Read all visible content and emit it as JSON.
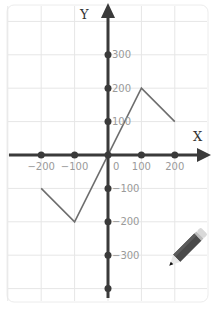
{
  "chart_data": {
    "type": "line",
    "title": "",
    "xlabel": "X",
    "ylabel": "Y",
    "xlim": [
      -300,
      300
    ],
    "ylim": [
      -400,
      400
    ],
    "grid": true,
    "x_ticks": [
      -200,
      -100,
      0,
      100,
      200
    ],
    "x_tick_labels": [
      "−200",
      "−100",
      "0",
      "100",
      "200"
    ],
    "y_ticks": [
      300,
      200,
      100,
      -100,
      -200,
      -300
    ],
    "y_tick_labels": [
      "300",
      "200",
      "100",
      "−100",
      "−200",
      "−300"
    ],
    "series": [
      {
        "name": "piecewise-line",
        "x": [
          -200,
          -100,
          100,
          200
        ],
        "y": [
          -100,
          -200,
          200,
          100
        ]
      }
    ],
    "annotations": [
      "pencil-icon"
    ]
  },
  "colors": {
    "axis": "#3a3a3a",
    "line": "#6e6e6e",
    "grid": "#e6e6e6",
    "tick_text": "#9a9a9a",
    "pencil_body": "#4a4a4a",
    "pencil_eraser": "#d9d9d9"
  }
}
